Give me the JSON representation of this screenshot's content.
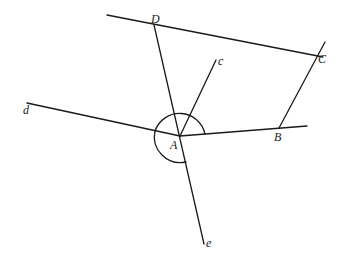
{
  "diagram": {
    "title": "",
    "stroke_color": "#1a1a1a",
    "points": {
      "A": {
        "label": "A",
        "x": 180,
        "y": 136
      },
      "B": {
        "label": "B",
        "x": 279,
        "y": 128
      },
      "C": {
        "label": "C",
        "x": 316,
        "y": 55
      },
      "D": {
        "label": "D",
        "x": 154,
        "y": 25
      }
    },
    "ray_labels": {
      "c": "c",
      "d": "d",
      "e": "e"
    },
    "segments": [
      {
        "name": "line-DC",
        "from": [
          107,
          15
        ],
        "to": [
          323,
          57
        ]
      },
      {
        "name": "line-CB",
        "from": [
          325,
          42
        ],
        "to": [
          279,
          128
        ]
      },
      {
        "name": "line-AB",
        "from": [
          180,
          136
        ],
        "to": [
          307,
          126
        ]
      },
      {
        "name": "ray-Ac",
        "from": [
          180,
          136
        ],
        "to": [
          216,
          60
        ]
      },
      {
        "name": "ray-Ad",
        "from": [
          27,
          103
        ],
        "to": [
          180,
          136
        ]
      },
      {
        "name": "line-De",
        "from": [
          154,
          25
        ],
        "to": [
          204,
          244
        ]
      }
    ],
    "angle_arcs": [
      {
        "name": "arc-dAB-upper",
        "description": "upper arc from ray d to ray AB"
      },
      {
        "name": "arc-dAe-lower",
        "description": "lower arc from ray d to ray e"
      }
    ]
  }
}
